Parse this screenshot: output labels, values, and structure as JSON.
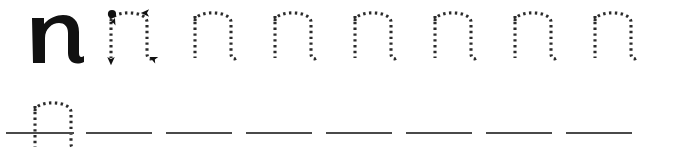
{
  "worksheet": {
    "title": "Lowercase letter n tracing practice",
    "letter": "n",
    "letter_case": "lowercase",
    "ink_color": "#111111",
    "dot_color": "#2b2b2b",
    "baseline_color": "#4a4a4a",
    "background_color": "#ffffff",
    "rows": [
      {
        "name": "row-practice-top",
        "has_baselines": false,
        "cells": [
          {
            "kind": "model",
            "letter": "n",
            "x": 28,
            "width": 52,
            "label": "solid model letter n"
          },
          {
            "kind": "guided",
            "letter": "n",
            "x": 104,
            "width": 52,
            "label": "dotted letter n with stroke order arrows"
          },
          {
            "kind": "dotted",
            "letter": "n",
            "x": 188,
            "width": 52,
            "label": "dotted tracing letter n"
          },
          {
            "kind": "dotted",
            "letter": "n",
            "x": 268,
            "width": 52,
            "label": "dotted tracing letter n"
          },
          {
            "kind": "dotted",
            "letter": "n",
            "x": 348,
            "width": 52,
            "label": "dotted tracing letter n"
          },
          {
            "kind": "dotted",
            "letter": "n",
            "x": 428,
            "width": 52,
            "label": "dotted tracing letter n"
          },
          {
            "kind": "dotted",
            "letter": "n",
            "x": 508,
            "width": 52,
            "label": "dotted tracing letter n"
          },
          {
            "kind": "dotted",
            "letter": "n",
            "x": 588,
            "width": 52,
            "label": "dotted tracing letter n"
          }
        ]
      },
      {
        "name": "row-practice-bottom",
        "has_baselines": true,
        "cells": [
          {
            "kind": "dotted",
            "letter": "n",
            "x": 28,
            "width": 52,
            "label": "dotted tracing letter n on baseline"
          },
          {
            "kind": "blank",
            "letter": "",
            "x": 108,
            "width": 52,
            "label": "blank writing line"
          },
          {
            "kind": "blank",
            "letter": "",
            "x": 188,
            "width": 52,
            "label": "blank writing line"
          },
          {
            "kind": "blank",
            "letter": "",
            "x": 268,
            "width": 52,
            "label": "blank writing line"
          },
          {
            "kind": "blank",
            "letter": "",
            "x": 348,
            "width": 52,
            "label": "blank writing line"
          },
          {
            "kind": "blank",
            "letter": "",
            "x": 428,
            "width": 52,
            "label": "blank writing line"
          },
          {
            "kind": "blank",
            "letter": "",
            "x": 508,
            "width": 52,
            "label": "blank writing line"
          },
          {
            "kind": "blank",
            "letter": "",
            "x": 588,
            "width": 52,
            "label": "blank writing line"
          }
        ]
      }
    ],
    "stroke_guides": {
      "start_dot": {
        "label": "stroke start point",
        "x": 8,
        "y": 9
      },
      "arrows": [
        {
          "name": "stem-down-arrow",
          "label": "arrow pointing down along the stem",
          "direction": "down"
        },
        {
          "name": "arch-right-arrow",
          "label": "arrow pointing right at top of arch",
          "direction": "right"
        },
        {
          "name": "leg-end-arrow",
          "label": "arrow pointing down-right at end of leg",
          "direction": "down-right"
        }
      ]
    }
  }
}
